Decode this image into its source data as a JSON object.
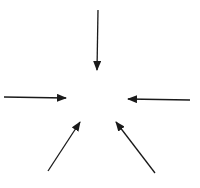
{
  "diagram": {
    "stroke_color": "#1a1a1a",
    "background": "#ffffff",
    "center": {
      "x": 97,
      "y": 100
    },
    "arrows": [
      {
        "id": "top",
        "x1": 98,
        "y1": 10,
        "x2": 97,
        "y2": 70
      },
      {
        "id": "left",
        "x1": 4,
        "y1": 97,
        "x2": 66,
        "y2": 98
      },
      {
        "id": "right",
        "x1": 190,
        "y1": 100,
        "x2": 128,
        "y2": 99
      },
      {
        "id": "bottom-left",
        "x1": 48,
        "y1": 171,
        "x2": 80,
        "y2": 122
      },
      {
        "id": "bottom-right",
        "x1": 155,
        "y1": 173,
        "x2": 116,
        "y2": 122
      }
    ]
  }
}
